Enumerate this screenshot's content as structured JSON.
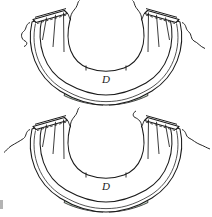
{
  "document": {
    "type": "technical-line-drawing",
    "description": "Two stacked U-shaped (horseshoe) sectional views of a band-like member with clamped ends and shaded bottom tabs",
    "background_color": "#ffffff",
    "line_color": "#1a1a1a",
    "shade_color": "#cfe0d0",
    "shade_color_dark": "#b9d2bb"
  },
  "figures": [
    {
      "id": "figure-top",
      "name": "upper-horseshoe-view",
      "dimension_label": "D",
      "notes": {
        "left_clamp": "left-clamp-band",
        "right_clamp": "right-clamp-band",
        "break_lines": 2,
        "shaded_tabs": 2,
        "tab_gap": true
      }
    },
    {
      "id": "figure-bottom",
      "name": "lower-horseshoe-view",
      "dimension_label": "D",
      "notes": {
        "left_clamp": "left-clamp-band",
        "right_clamp": "right-clamp-band",
        "break_lines": 2,
        "shaded_tabs": 2,
        "tab_gap": true
      }
    }
  ],
  "labels": {
    "top_dimension": "D",
    "bottom_dimension": "D"
  }
}
